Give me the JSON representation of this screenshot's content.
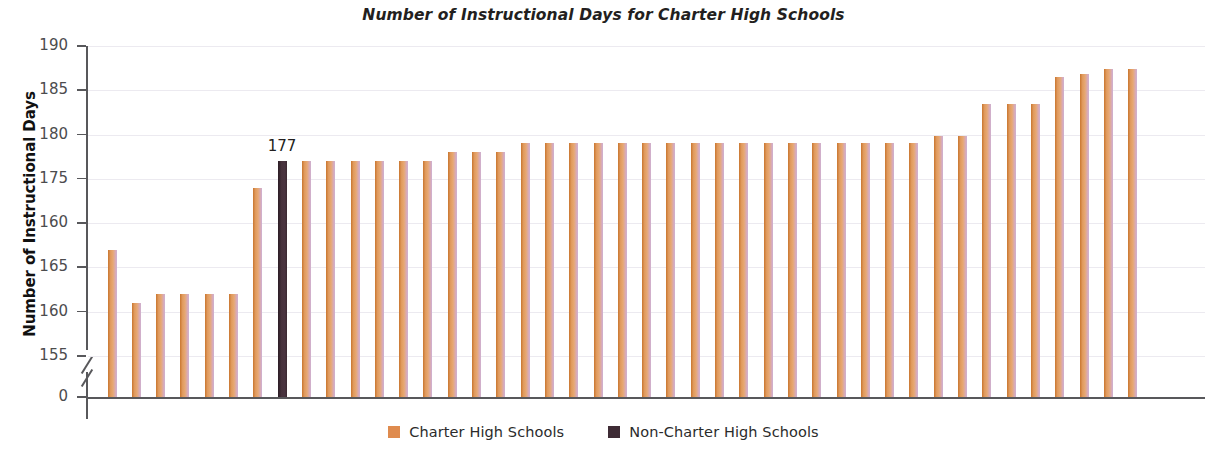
{
  "chart_data": {
    "type": "bar",
    "title": "Number of Instructional Days for Charter High Schools",
    "xlabel": "",
    "ylabel": "Number of Instructional Days",
    "grid": true,
    "legend_position": "bottom-center",
    "y_axis": {
      "tick_labels": [
        "190",
        "185",
        "180",
        "175",
        "160",
        "165",
        "160",
        "155",
        "0"
      ],
      "tick_values": [
        190,
        185,
        180,
        175,
        170,
        165,
        160,
        155,
        0
      ],
      "broken_axis": true,
      "break_between": [
        0,
        155
      ],
      "ylim": [
        155,
        190
      ]
    },
    "series": [
      {
        "name": "Charter High Schools",
        "color": "#df8b4e"
      },
      {
        "name": "Non-Charter High Schools",
        "color": "#3e2b35"
      }
    ],
    "annotations": [
      {
        "text": "177",
        "for_bar_index": 7,
        "value": 177
      }
    ],
    "bars": [
      {
        "value": 167,
        "group": "charter"
      },
      {
        "value": 161,
        "group": "charter"
      },
      {
        "value": 162,
        "group": "charter"
      },
      {
        "value": 162,
        "group": "charter"
      },
      {
        "value": 162,
        "group": "charter"
      },
      {
        "value": 162,
        "group": "charter"
      },
      {
        "value": 174,
        "group": "charter"
      },
      {
        "value": 177,
        "group": "non-charter",
        "label": "177"
      },
      {
        "value": 177,
        "group": "charter"
      },
      {
        "value": 177,
        "group": "charter"
      },
      {
        "value": 177,
        "group": "charter"
      },
      {
        "value": 177,
        "group": "charter"
      },
      {
        "value": 177,
        "group": "charter"
      },
      {
        "value": 177,
        "group": "charter"
      },
      {
        "value": 178,
        "group": "charter"
      },
      {
        "value": 178,
        "group": "charter"
      },
      {
        "value": 178,
        "group": "charter"
      },
      {
        "value": 179,
        "group": "charter"
      },
      {
        "value": 179,
        "group": "charter"
      },
      {
        "value": 179,
        "group": "charter"
      },
      {
        "value": 179,
        "group": "charter"
      },
      {
        "value": 179,
        "group": "charter"
      },
      {
        "value": 179,
        "group": "charter"
      },
      {
        "value": 179,
        "group": "charter"
      },
      {
        "value": 179,
        "group": "charter"
      },
      {
        "value": 179,
        "group": "charter"
      },
      {
        "value": 179,
        "group": "charter"
      },
      {
        "value": 179,
        "group": "charter"
      },
      {
        "value": 179,
        "group": "charter"
      },
      {
        "value": 179,
        "group": "charter"
      },
      {
        "value": 179,
        "group": "charter"
      },
      {
        "value": 179,
        "group": "charter"
      },
      {
        "value": 179,
        "group": "charter"
      },
      {
        "value": 179,
        "group": "charter"
      },
      {
        "value": 179.8,
        "group": "charter"
      },
      {
        "value": 179.8,
        "group": "charter"
      },
      {
        "value": 183.5,
        "group": "charter"
      },
      {
        "value": 183.5,
        "group": "charter"
      },
      {
        "value": 183.5,
        "group": "charter"
      },
      {
        "value": 186.5,
        "group": "charter"
      },
      {
        "value": 186.8,
        "group": "charter"
      },
      {
        "value": 187.4,
        "group": "charter"
      },
      {
        "value": 187.4,
        "group": "charter"
      }
    ]
  },
  "legend": {
    "items": [
      {
        "label": "Charter High Schools",
        "color": "#df8b4e"
      },
      {
        "label": "Non-Charter High Schools",
        "color": "#3e2b35"
      }
    ]
  }
}
